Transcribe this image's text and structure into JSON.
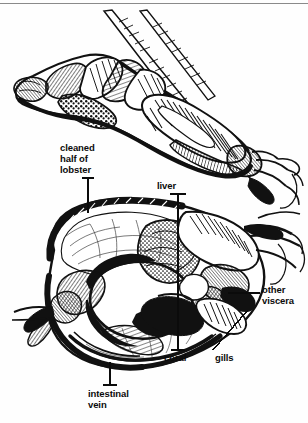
{
  "figure": {
    "subject": "lobster",
    "style": "black-and-white pen-and-ink line drawing with hatching",
    "top_rule_color": "#8a8a8a",
    "ink_color": "#111111",
    "paper_color": "#fefefe"
  },
  "callouts": [
    {
      "id": "cleaned-half",
      "text": "cleaned\nhalf of\nlobster",
      "lines": [
        "cleaned",
        "half of",
        "lobster"
      ],
      "align": "left",
      "leader": "vertical line with cross tick at top"
    },
    {
      "id": "liver",
      "text": "liver",
      "lines": [
        "liver"
      ],
      "align": "left",
      "leader": "long vertical line with cross tick at top"
    },
    {
      "id": "other-viscera",
      "text": "other\nviscera",
      "lines": [
        "other",
        "viscera"
      ],
      "align": "left",
      "leader": "horizontal line to the left"
    },
    {
      "id": "coral",
      "text": "coral",
      "lines": [
        "coral"
      ],
      "align": "left",
      "leader": "vertical line with cross tick at top"
    },
    {
      "id": "gills",
      "text": "gills",
      "lines": [
        "gills"
      ],
      "align": "left",
      "leader": "diagonal line going up-left"
    },
    {
      "id": "intestinal-vein",
      "text": "intestinal\nvein",
      "lines": [
        "intestinal",
        "vein"
      ],
      "align": "left",
      "leader": "vertical line with cross tick at top"
    }
  ],
  "anatomy_parts": [
    "cleaned half of lobster",
    "liver",
    "other viscera",
    "coral",
    "gills",
    "intestinal vein"
  ]
}
